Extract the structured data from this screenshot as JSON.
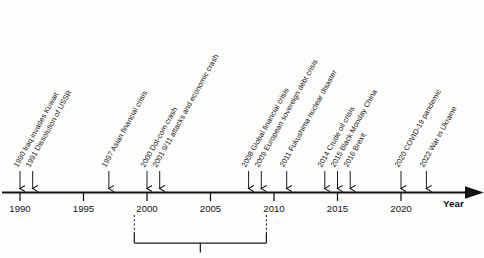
{
  "figure": {
    "type": "timeline",
    "axis_title": "Year",
    "background_color": "#fdfdfc",
    "line_color": "#111111"
  },
  "axis": {
    "ticks": [
      {
        "year": 1990,
        "label": "1990"
      },
      {
        "year": 1995,
        "label": "1995"
      },
      {
        "year": 2000,
        "label": "2000"
      },
      {
        "year": 2005,
        "label": "2005"
      },
      {
        "year": 2010,
        "label": "2010"
      },
      {
        "year": 2015,
        "label": "2015"
      },
      {
        "year": 2020,
        "label": "2020"
      }
    ],
    "range": [
      1988.5,
      2025.5
    ],
    "title": "Year"
  },
  "events": [
    {
      "year": 1990,
      "label": "1990 Iraq invades Kuwait"
    },
    {
      "year": 1991,
      "label": "1991 Dissolution of USSR"
    },
    {
      "year": 1997,
      "label": "1997 Asian financial crisis"
    },
    {
      "year": 2000,
      "label": "2000 Dot-com crash"
    },
    {
      "year": 2001,
      "label": "2001 9/11 attacks and economic crash"
    },
    {
      "year": 2008,
      "label": "2008 Global financial crisis"
    },
    {
      "year": 2009,
      "label": "2009 European sovereign debt crisis"
    },
    {
      "year": 2011,
      "label": "2011 Fukushima nuclear disaster"
    },
    {
      "year": 2014,
      "label": "2014 Crude oil crisis"
    },
    {
      "year": 2015,
      "label": "2015 Black Monday China"
    },
    {
      "year": 2016,
      "label": "2016 Brexit"
    },
    {
      "year": 2020,
      "label": "2020 COVID-19 pandemic"
    },
    {
      "year": 2022,
      "label": "2022 War in Ukraine"
    }
  ],
  "bracket": {
    "start_year": 1999,
    "end_year": 2009.4,
    "label": ""
  },
  "chart_data": {
    "type": "timeline",
    "title": "",
    "xlabel": "Year",
    "ylabel": "",
    "xlim": [
      1988.5,
      2025.5
    ],
    "grid": false,
    "legend": "none",
    "categories": [
      1990,
      1991,
      1997,
      2000,
      2001,
      2008,
      2009,
      2011,
      2014,
      2015,
      2016,
      2020,
      2022
    ],
    "annotations": [
      "1990 Iraq invades Kuwait",
      "1991 Dissolution of USSR",
      "1997 Asian financial crisis",
      "2000 Dot-com crash",
      "2001 9/11 attacks and economic crash",
      "2008 Global financial crisis",
      "2009 European sovereign debt crisis",
      "2011 Fukushima nuclear disaster",
      "2014 Crude oil crisis",
      "2015 Black Monday China",
      "2016 Brexit",
      "2020 COVID-19 pandemic",
      "2022 War in Ukraine"
    ],
    "tick_labels": [
      "1990",
      "1995",
      "2000",
      "2005",
      "2010",
      "2015",
      "2020"
    ]
  }
}
